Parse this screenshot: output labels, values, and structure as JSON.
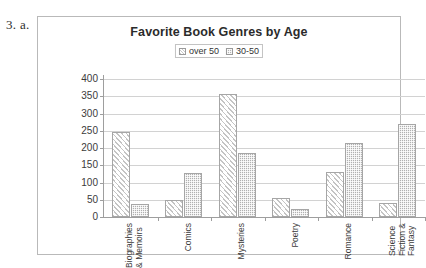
{
  "question_label": "3. a.",
  "chart_data": {
    "type": "bar",
    "title": "Favorite Book Genres by Age",
    "xlabel": "",
    "ylabel": "",
    "ylim": [
      0,
      400
    ],
    "ytick_step": 50,
    "yticks": [
      "400",
      "350",
      "300",
      "250",
      "200",
      "150",
      "100",
      "50",
      "0"
    ],
    "grid": true,
    "legend_position": "top-center",
    "categories": [
      "Biographies\n& Memoirs",
      "Comics",
      "Mysteries",
      "Poetry",
      "Romance",
      "Science\nFiction &\nFantasy"
    ],
    "series": [
      {
        "name": "over 50",
        "pattern": "diagonal-hatch",
        "color": "#ffffff",
        "values": [
          247,
          48,
          357,
          55,
          130,
          40
        ]
      },
      {
        "name": "30-50",
        "pattern": "checker-gray",
        "color": "#b0b0b0",
        "values": [
          38,
          127,
          186,
          24,
          215,
          271
        ]
      }
    ]
  }
}
